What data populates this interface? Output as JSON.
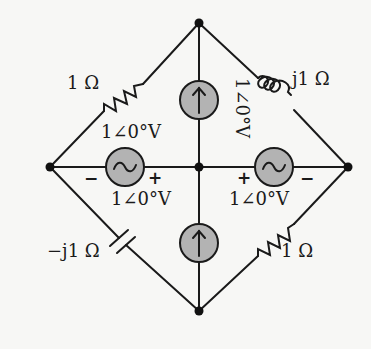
{
  "diagram": {
    "type": "ac-circuit",
    "background": "#f7f7f5",
    "source_fill": "#b3b3b3",
    "nodes": [
      {
        "id": "top",
        "x": 199,
        "y": 23
      },
      {
        "id": "left",
        "x": 50,
        "y": 167
      },
      {
        "id": "center",
        "x": 199,
        "y": 167
      },
      {
        "id": "right",
        "x": 348,
        "y": 167
      },
      {
        "id": "bottom",
        "x": 199,
        "y": 311
      }
    ],
    "components": {
      "top_left_resistor": {
        "label": "1 Ω",
        "kind": "resistor",
        "between": [
          "left",
          "top"
        ]
      },
      "top_right_inductor": {
        "label": "j1 Ω",
        "kind": "inductor",
        "between": [
          "top",
          "right"
        ]
      },
      "bottom_left_capacitor": {
        "label": "−j1 Ω",
        "kind": "capacitor",
        "between": [
          "left",
          "bottom"
        ]
      },
      "bottom_right_resistor": {
        "label": "1 Ω",
        "kind": "resistor",
        "between": [
          "bottom",
          "right"
        ]
      },
      "top_current_source": {
        "label": "1∠0°V",
        "kind": "current-source",
        "direction": "up",
        "between": [
          "center",
          "top"
        ]
      },
      "bottom_current_source": {
        "label": "1∠0°V",
        "kind": "current-source",
        "direction": "up",
        "between": [
          "bottom",
          "center"
        ]
      },
      "left_voltage_source": {
        "label_above": "1∠0°V",
        "label_below": "1∠0°V",
        "kind": "ac-voltage-source",
        "minus": "−",
        "plus": "+",
        "between": [
          "left",
          "center"
        ]
      },
      "right_voltage_source": {
        "label": "1∠0°V",
        "kind": "ac-voltage-source",
        "minus": "−",
        "plus": "+",
        "between": [
          "center",
          "right"
        ]
      }
    }
  }
}
